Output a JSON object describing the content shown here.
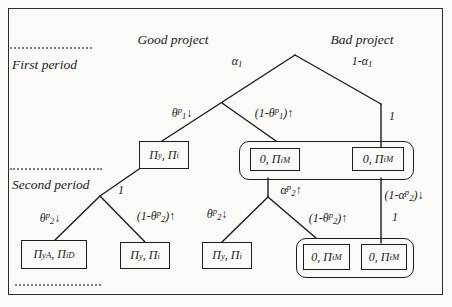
{
  "headers": {
    "good_project": "Good project",
    "bad_project": "Bad project"
  },
  "periods": {
    "first": "First period",
    "second": "Second period"
  },
  "edges": {
    "alpha_1": [
      [
        "n",
        "α"
      ],
      [
        "sub",
        "1"
      ]
    ],
    "one_minus_alpha_1": [
      [
        "n",
        "1-α"
      ],
      [
        "sub",
        "1"
      ]
    ],
    "theta_p_1_down": [
      [
        "n",
        "θ"
      ],
      [
        "sup",
        "p"
      ],
      [
        "sub",
        "1"
      ],
      [
        "n",
        "↓"
      ]
    ],
    "one_minus_theta_p_1_up": [
      [
        "n",
        "(1-θ"
      ],
      [
        "sup",
        "p"
      ],
      [
        "sub",
        "1"
      ],
      [
        "n",
        ")↑"
      ]
    ],
    "theta_p_2_down": [
      [
        "n",
        "θ"
      ],
      [
        "sup",
        "p"
      ],
      [
        "sub",
        "2"
      ],
      [
        "n",
        "↓"
      ]
    ],
    "one_minus_theta_p_2_up": [
      [
        "n",
        "(1-θ"
      ],
      [
        "sup",
        "p"
      ],
      [
        "sub",
        "2"
      ],
      [
        "n",
        ")↑"
      ]
    ],
    "alpha_p_2_up": [
      [
        "n",
        "α"
      ],
      [
        "sup",
        "p"
      ],
      [
        "sub",
        "2"
      ],
      [
        "n",
        "↑"
      ]
    ],
    "one_minus_alpha_p_2_down": [
      [
        "n",
        "(1-α"
      ],
      [
        "sup",
        "p"
      ],
      [
        "sub",
        "2"
      ],
      [
        "n",
        ")↓"
      ]
    ],
    "prob_one": "1"
  },
  "payoffs": {
    "pi_y_pi_i": [
      [
        "n",
        "Π"
      ],
      [
        "sub",
        "y"
      ],
      [
        "n",
        ", Π"
      ],
      [
        "sub",
        "i"
      ]
    ],
    "zero_pi_i_M": [
      [
        "n",
        "0, Π"
      ],
      [
        "sub",
        "i"
      ],
      [
        "sup",
        "M"
      ]
    ],
    "pi_y_A_pi_i_D": [
      [
        "n",
        "Π"
      ],
      [
        "sub",
        "y"
      ],
      [
        "sup",
        "A"
      ],
      [
        "n",
        ", Π"
      ],
      [
        "sub",
        "i"
      ],
      [
        "sup",
        "D"
      ]
    ]
  }
}
